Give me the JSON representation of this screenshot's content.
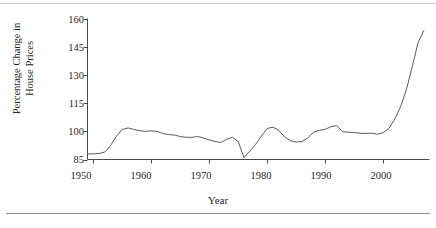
{
  "figure": {
    "name": "house-price-index-line-chart",
    "line_color": "#5a5a5a",
    "axis_color": "#4a4a4a",
    "rule_color": "#8f8f8f"
  },
  "axis": {
    "y_label_line1": "Percentage Change in",
    "y_label_line2": "House Prices",
    "x_label": "Year",
    "y_ticks": [
      160,
      145,
      130,
      115,
      100,
      85
    ],
    "x_ticks": [
      1950,
      1960,
      1970,
      1980,
      1990,
      2000
    ]
  },
  "chart_data": {
    "type": "line",
    "title": "",
    "xlabel": "Year",
    "ylabel": "Percentage Change in House Prices",
    "xlim": [
      1949,
      2008
    ],
    "ylim": [
      85,
      160
    ],
    "grid": false,
    "legend": false,
    "x_tick_labels": [
      "1950",
      "1960",
      "1970",
      "1980",
      "1990",
      "2000"
    ],
    "y_tick_labels": [
      "85",
      "100",
      "115",
      "130",
      "145",
      "160"
    ],
    "series": [
      {
        "name": "House Price Index",
        "x": [
          1949,
          1950,
          1951,
          1952,
          1953,
          1954,
          1955,
          1956,
          1957,
          1958,
          1959,
          1960,
          1961,
          1962,
          1963,
          1964,
          1965,
          1966,
          1967,
          1968,
          1969,
          1970,
          1971,
          1972,
          1973,
          1974,
          1975,
          1976,
          1977,
          1978,
          1979,
          1980,
          1981,
          1982,
          1983,
          1984,
          1985,
          1986,
          1987,
          1988,
          1989,
          1990,
          1991,
          1992,
          1993,
          1994,
          1995,
          1996,
          1997,
          1998,
          1999,
          2000,
          2001,
          2002,
          2003,
          2004,
          2005,
          2006,
          2007
        ],
        "values": [
          88.0,
          88.0,
          88.2,
          89.0,
          92.5,
          97.5,
          101.0,
          101.8,
          101.0,
          100.3,
          100.0,
          100.2,
          100.0,
          98.8,
          98.3,
          98.0,
          97.2,
          96.8,
          96.8,
          97.2,
          96.5,
          95.4,
          94.6,
          94.0,
          95.8,
          96.8,
          94.5,
          86.0,
          89.5,
          93.0,
          97.5,
          101.5,
          102.2,
          100.5,
          97.0,
          95.0,
          94.3,
          94.5,
          96.5,
          99.5,
          100.5,
          101.0,
          102.5,
          103.0,
          99.8,
          99.5,
          99.4,
          99.0,
          98.8,
          99.0,
          98.4,
          99.3,
          101.5,
          106.5,
          113.0,
          122.0,
          134.0,
          147.0,
          153.5
        ]
      }
    ],
    "annotations": []
  }
}
